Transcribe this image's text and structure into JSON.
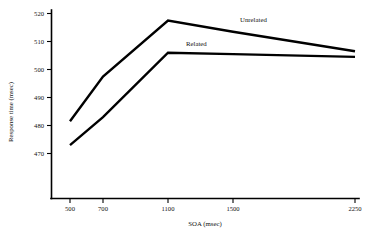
{
  "chart_data": {
    "type": "line",
    "title": "",
    "xlabel": "SOA (msec)",
    "ylabel": "Response time (msec)",
    "x": [
      500,
      700,
      1100,
      1500,
      2250
    ],
    "xticklabels": [
      "500",
      "700",
      "1100",
      "1500",
      "2250"
    ],
    "yticks": [
      470,
      480,
      490,
      500,
      510,
      520
    ],
    "yticklabels": [
      "470",
      "480",
      "490",
      "500",
      "510",
      "520"
    ],
    "xlim": [
      430,
      2330
    ],
    "ylim": [
      464,
      522
    ],
    "grid": false,
    "legend_position": "inline-annotation",
    "series": [
      {
        "name": "Unrelated",
        "values": [
          481.5,
          497.5,
          517.5,
          513.5,
          506.5
        ],
        "label_text": "Unrelated"
      },
      {
        "name": "Related",
        "values": [
          473.0,
          483.0,
          506.0,
          505.5,
          504.5
        ],
        "label_text": "Related"
      }
    ]
  },
  "axes": {
    "y_title": "Response time (msec)",
    "x_title": "SOA (msec)",
    "y_tick_labels": [
      "520",
      "510",
      "500",
      "490",
      "480",
      "470"
    ],
    "x_tick_labels": [
      "500",
      "700",
      "1100",
      "1500",
      "2250"
    ]
  },
  "annotations": {
    "unrelated_label": "Unrelated",
    "related_label": "Related"
  },
  "colors": {
    "line": "#000000",
    "axis": "#000000",
    "background": "#ffffff",
    "text": "#111111"
  }
}
